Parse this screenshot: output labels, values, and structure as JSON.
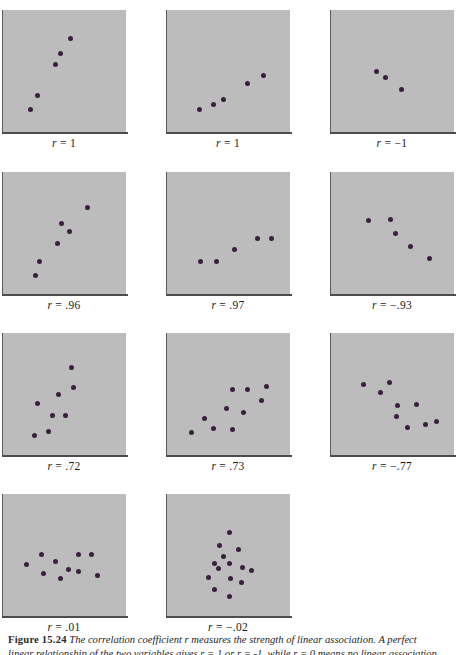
{
  "figure": {
    "number": "Figure 15.24",
    "caption_line1": "The correlation coefficient r measures the strength of linear association. A perfect",
    "caption_line2": "linear relationship of the two variables gives r = 1 or r = -1, while r = 0 means no linear association."
  },
  "chart_data": {
    "type": "scatter",
    "title": "Figure 15.24",
    "grid": false,
    "legend": false,
    "xlabel": "",
    "ylabel": "",
    "xlim": [
      0,
      1
    ],
    "ylim": [
      0,
      1
    ],
    "panel_grid": {
      "columns": 3,
      "rows": 4
    },
    "panels": [
      {
        "id": "panel-1",
        "label": "r = 1",
        "r": 1,
        "n_points": 5,
        "points": [
          {
            "x": 0.17,
            "y": 0.13
          },
          {
            "x": 0.24,
            "y": 0.27
          },
          {
            "x": 0.41,
            "y": 0.57
          },
          {
            "x": 0.46,
            "y": 0.67
          },
          {
            "x": 0.55,
            "y": 0.82
          }
        ]
      },
      {
        "id": "panel-2",
        "label": "r = 1",
        "r": 1,
        "n_points": 5,
        "points": [
          {
            "x": 0.22,
            "y": 0.13
          },
          {
            "x": 0.35,
            "y": 0.18
          },
          {
            "x": 0.45,
            "y": 0.23
          },
          {
            "x": 0.68,
            "y": 0.38
          },
          {
            "x": 0.83,
            "y": 0.46
          }
        ]
      },
      {
        "id": "panel-3",
        "label": "r = −1",
        "r": -1,
        "n_points": 3,
        "points": [
          {
            "x": 0.34,
            "y": 0.5
          },
          {
            "x": 0.43,
            "y": 0.44
          },
          {
            "x": 0.58,
            "y": 0.33
          }
        ]
      },
      {
        "id": "panel-4",
        "label": "r = .96",
        "r": 0.96,
        "n_points": 6,
        "points": [
          {
            "x": 0.22,
            "y": 0.09
          },
          {
            "x": 0.25,
            "y": 0.23
          },
          {
            "x": 0.43,
            "y": 0.4
          },
          {
            "x": 0.54,
            "y": 0.52
          },
          {
            "x": 0.47,
            "y": 0.6
          },
          {
            "x": 0.72,
            "y": 0.75
          }
        ]
      },
      {
        "id": "panel-5",
        "label": "r = .97",
        "r": 0.97,
        "n_points": 5,
        "points": [
          {
            "x": 0.23,
            "y": 0.23
          },
          {
            "x": 0.38,
            "y": 0.23
          },
          {
            "x": 0.55,
            "y": 0.34
          },
          {
            "x": 0.77,
            "y": 0.45
          },
          {
            "x": 0.91,
            "y": 0.45
          }
        ]
      },
      {
        "id": "panel-6",
        "label": "r = −.93",
        "r": -0.93,
        "n_points": 5,
        "points": [
          {
            "x": 0.26,
            "y": 0.63
          },
          {
            "x": 0.48,
            "y": 0.64
          },
          {
            "x": 0.52,
            "y": 0.5
          },
          {
            "x": 0.67,
            "y": 0.37
          },
          {
            "x": 0.85,
            "y": 0.26
          }
        ]
      },
      {
        "id": "panel-7",
        "label": "r = .72",
        "r": 0.72,
        "n_points": 8,
        "points": [
          {
            "x": 0.21,
            "y": 0.1
          },
          {
            "x": 0.34,
            "y": 0.14
          },
          {
            "x": 0.24,
            "y": 0.41
          },
          {
            "x": 0.38,
            "y": 0.3
          },
          {
            "x": 0.5,
            "y": 0.3
          },
          {
            "x": 0.44,
            "y": 0.5
          },
          {
            "x": 0.58,
            "y": 0.57
          },
          {
            "x": 0.56,
            "y": 0.76
          }
        ]
      },
      {
        "id": "panel-8",
        "label": "r = .73",
        "r": 0.73,
        "n_points": 10,
        "points": [
          {
            "x": 0.14,
            "y": 0.13
          },
          {
            "x": 0.35,
            "y": 0.17
          },
          {
            "x": 0.26,
            "y": 0.27
          },
          {
            "x": 0.53,
            "y": 0.16
          },
          {
            "x": 0.48,
            "y": 0.36
          },
          {
            "x": 0.64,
            "y": 0.33
          },
          {
            "x": 0.53,
            "y": 0.55
          },
          {
            "x": 0.68,
            "y": 0.55
          },
          {
            "x": 0.81,
            "y": 0.44
          },
          {
            "x": 0.86,
            "y": 0.58
          }
        ]
      },
      {
        "id": "panel-9",
        "label": "r = −.77",
        "r": -0.77,
        "n_points": 10,
        "points": [
          {
            "x": 0.22,
            "y": 0.6
          },
          {
            "x": 0.47,
            "y": 0.62
          },
          {
            "x": 0.38,
            "y": 0.52
          },
          {
            "x": 0.54,
            "y": 0.39
          },
          {
            "x": 0.53,
            "y": 0.29
          },
          {
            "x": 0.73,
            "y": 0.4
          },
          {
            "x": 0.64,
            "y": 0.18
          },
          {
            "x": 0.81,
            "y": 0.21
          },
          {
            "x": 0.92,
            "y": 0.24
          }
        ]
      },
      {
        "id": "panel-10",
        "label": "r = .01",
        "r": 0.01,
        "n_points": 10,
        "points": [
          {
            "x": 0.13,
            "y": 0.41
          },
          {
            "x": 0.27,
            "y": 0.51
          },
          {
            "x": 0.29,
            "y": 0.33
          },
          {
            "x": 0.41,
            "y": 0.44
          },
          {
            "x": 0.46,
            "y": 0.28
          },
          {
            "x": 0.53,
            "y": 0.36
          },
          {
            "x": 0.63,
            "y": 0.34
          },
          {
            "x": 0.63,
            "y": 0.51
          },
          {
            "x": 0.75,
            "y": 0.51
          },
          {
            "x": 0.81,
            "y": 0.31
          }
        ]
      },
      {
        "id": "panel-11",
        "label": "r = −.02",
        "r": -0.02,
        "n_points": 14,
        "points": [
          {
            "x": 0.5,
            "y": 0.72
          },
          {
            "x": 0.41,
            "y": 0.6
          },
          {
            "x": 0.59,
            "y": 0.56
          },
          {
            "x": 0.45,
            "y": 0.49
          },
          {
            "x": 0.36,
            "y": 0.42
          },
          {
            "x": 0.5,
            "y": 0.42
          },
          {
            "x": 0.4,
            "y": 0.37
          },
          {
            "x": 0.63,
            "y": 0.38
          },
          {
            "x": 0.72,
            "y": 0.35
          },
          {
            "x": 0.3,
            "y": 0.29
          },
          {
            "x": 0.51,
            "y": 0.28
          },
          {
            "x": 0.62,
            "y": 0.24
          },
          {
            "x": 0.36,
            "y": 0.17
          },
          {
            "x": 0.5,
            "y": 0.1
          }
        ]
      }
    ]
  },
  "layout": {
    "panel_positions": [
      {
        "left": 2,
        "top": 10
      },
      {
        "left": 166,
        "top": 10
      },
      {
        "left": 330,
        "top": 10
      },
      {
        "left": 2,
        "top": 172
      },
      {
        "left": 166,
        "top": 172
      },
      {
        "left": 330,
        "top": 172
      },
      {
        "left": 2,
        "top": 333
      },
      {
        "left": 166,
        "top": 333
      },
      {
        "left": 330,
        "top": 333
      },
      {
        "left": 2,
        "top": 494
      },
      {
        "left": 166,
        "top": 494
      }
    ]
  }
}
